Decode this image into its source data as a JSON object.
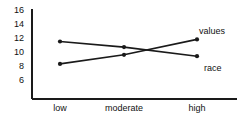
{
  "chart_data": {
    "type": "line",
    "title": "",
    "xlabel": "",
    "ylabel": "",
    "categories": [
      "low",
      "moderate",
      "high"
    ],
    "yticks": [
      16,
      14,
      12,
      10,
      8,
      6
    ],
    "ylim": [
      5,
      16
    ],
    "grid": false,
    "legend_position": "right-inline",
    "markers": "filled-circle",
    "line_color": "#1a1a1a",
    "axis_color": "#1a1a1a",
    "background": "#ffffff",
    "series": [
      {
        "name": "values",
        "values": [
          8.3,
          9.6,
          11.8
        ]
      },
      {
        "name": "race",
        "values": [
          11.5,
          10.7,
          9.4
        ]
      }
    ]
  },
  "axis": {
    "y_labels": [
      "16",
      "14",
      "12",
      "10",
      "8",
      "6"
    ],
    "x_labels": [
      "low",
      "moderate",
      "high"
    ]
  },
  "labels": {
    "values": "values",
    "race": "race"
  }
}
